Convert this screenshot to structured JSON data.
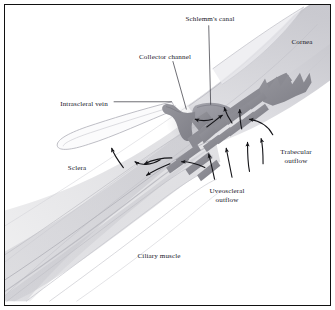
{
  "figure": {
    "kind": "anatomical-illustration",
    "style": "grayscale medical illustration with thin black rectangular frame",
    "background_color": "#ffffff",
    "frame_color": "#111111",
    "label_color": "#17171f"
  },
  "labels": [
    {
      "id": "schlemms-canal",
      "text": "Schlemm's canal",
      "x": 205,
      "y": 14,
      "anchor": "center",
      "lines": 1
    },
    {
      "id": "cornea",
      "text": "Cornea",
      "x": 297,
      "y": 37,
      "anchor": "center",
      "lines": 1
    },
    {
      "id": "collector-channel",
      "text": "Collector channel",
      "x": 160,
      "y": 52,
      "anchor": "center",
      "lines": 1
    },
    {
      "id": "intrascleral-vein",
      "text": "Intrascleral vein",
      "x": 79,
      "y": 99,
      "anchor": "center",
      "lines": 1
    },
    {
      "id": "trabecular-outflow",
      "text": "Trabecular\noutflow",
      "x": 291,
      "y": 152,
      "anchor": "center",
      "lines": 2,
      "line1": "Trabecular",
      "line2": "outflow"
    },
    {
      "id": "uveoscleral-outflow",
      "text": "Uveoscleral\noutflow",
      "x": 222,
      "y": 191,
      "anchor": "center",
      "lines": 2,
      "line1": "Uveoscleral",
      "line2": "outflow"
    },
    {
      "id": "sclera",
      "text": "Sclera",
      "x": 72,
      "y": 163,
      "anchor": "center",
      "lines": 1
    },
    {
      "id": "ciliary-muscle",
      "text": "Ciliary muscle",
      "x": 154,
      "y": 251,
      "anchor": "center",
      "lines": 1
    }
  ],
  "leader_lines": [
    {
      "id": "leader-schlemms-canal",
      "from": [
        210,
        21
      ],
      "to": [
        212,
        103
      ]
    },
    {
      "id": "leader-collector-channel",
      "from": [
        173,
        58
      ],
      "to": [
        186,
        108
      ]
    },
    {
      "id": "leader-intrascleral-vein",
      "from": [
        112,
        100
      ],
      "to": [
        172,
        100
      ]
    }
  ],
  "structures": [
    {
      "id": "sclera-body",
      "label": "Sclera",
      "tone": "#e3e3e5",
      "description": "broad pale diagonal band sweeping lower-left to upper-right"
    },
    {
      "id": "cornea-body",
      "label": "Cornea",
      "tone": "#dcdcdf",
      "description": "curved banded layers at upper right"
    },
    {
      "id": "trabecular-meshwork",
      "label": "Trabecular meshwork",
      "tone": "#8e8e96",
      "description": "dark grey comb-like zigzag lamellae in the centre"
    },
    {
      "id": "schlemms-canal-body",
      "label": "Schlemm's canal",
      "tone": "#9a9aa2",
      "description": "dark grey lumen beside the meshwork"
    },
    {
      "id": "collector-channel-body",
      "label": "Collector channel",
      "tone": "#8e8e96",
      "description": "dark grey stub branching left from the canal"
    },
    {
      "id": "intrascleral-vein-body",
      "label": "Intrascleral vein",
      "tone": "#ffffff",
      "description": "thin outlined elongated loop within the sclera"
    },
    {
      "id": "ciliary-muscle-body",
      "label": "Ciliary muscle",
      "tone": "#c9c9ce",
      "description": "long sweeping fibre bundles toward lower left"
    }
  ],
  "flow_arrows": [
    {
      "id": "arrow-trabecular-1",
      "pathway": "Trabecular outflow",
      "direction": "up-left"
    },
    {
      "id": "arrow-trabecular-2",
      "pathway": "Trabecular outflow",
      "direction": "up-left"
    },
    {
      "id": "arrow-trabecular-3",
      "pathway": "Trabecular outflow",
      "direction": "up"
    },
    {
      "id": "arrow-trabecular-4",
      "pathway": "Trabecular outflow",
      "direction": "curve-left"
    },
    {
      "id": "arrow-uveoscleral-1",
      "pathway": "Uveoscleral outflow",
      "direction": "up"
    },
    {
      "id": "arrow-uveoscleral-2",
      "pathway": "Uveoscleral outflow",
      "direction": "up"
    },
    {
      "id": "arrow-uveoscleral-3",
      "pathway": "Uveoscleral outflow",
      "direction": "up-left"
    },
    {
      "id": "arrow-uveoscleral-4",
      "pathway": "Uveoscleral outflow",
      "direction": "left"
    },
    {
      "id": "arrow-scleral-1",
      "pathway": "Intrascleral drainage",
      "direction": "up-left"
    },
    {
      "id": "arrow-scleral-2",
      "pathway": "Intrascleral drainage",
      "direction": "down-left"
    },
    {
      "id": "arrow-scleral-3",
      "pathway": "Intrascleral drainage",
      "direction": "left"
    }
  ]
}
